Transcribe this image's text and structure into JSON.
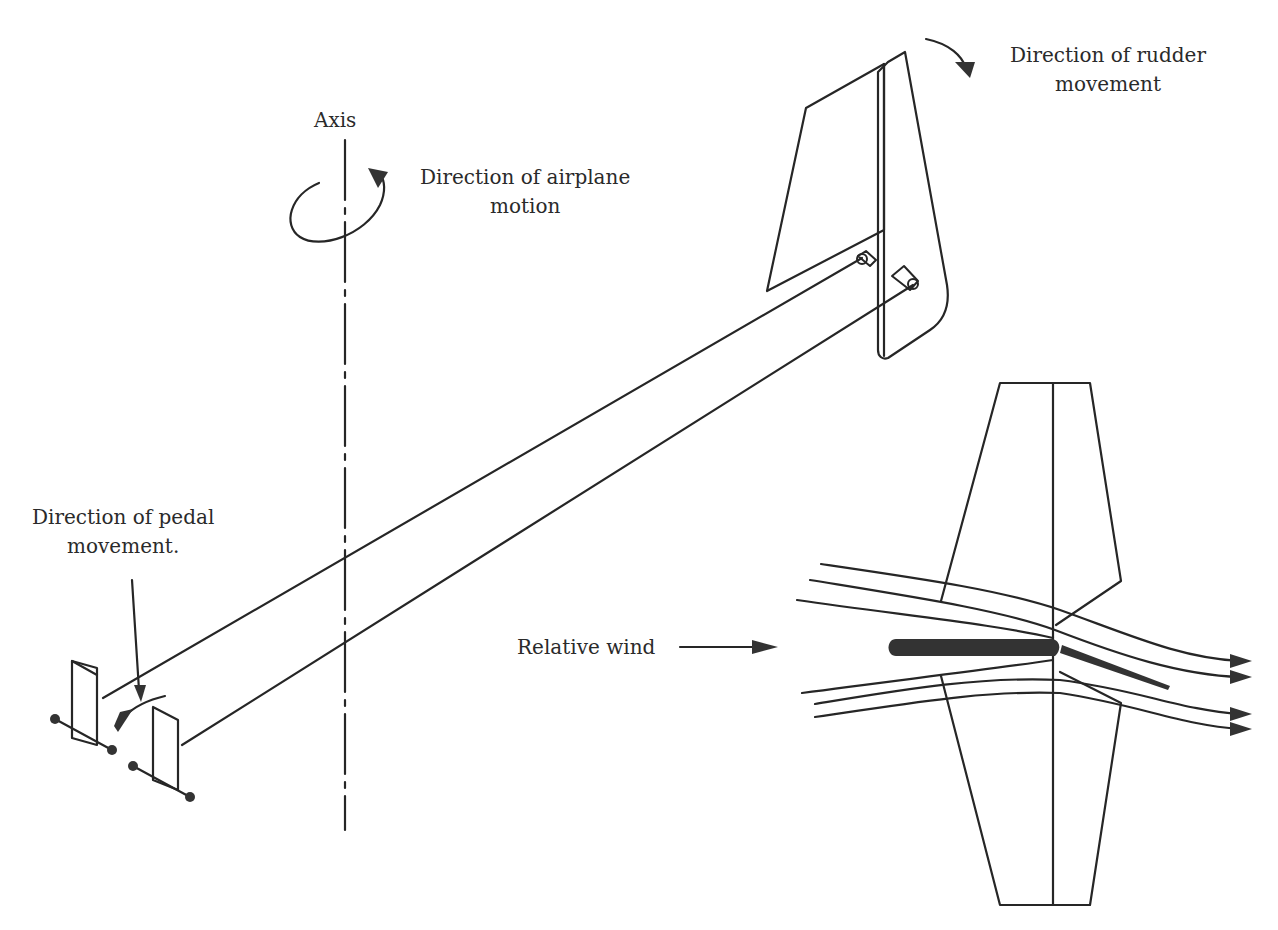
{
  "figure": {
    "colors": {
      "ink": "#262626",
      "background": "#ffffff",
      "airfoil_fill": "#3a3a3a"
    }
  },
  "labels": {
    "axis": "Axis",
    "airplane_motion_line1": "Direction of airplane",
    "airplane_motion_line2": "motion",
    "rudder_movement_line1": "Direction of rudder",
    "rudder_movement_line2": "movement",
    "pedal_movement_line1": "Direction of pedal",
    "pedal_movement_line2": "movement.",
    "relative_wind": "Relative wind"
  },
  "components": [
    {
      "id": "vertical-axis",
      "style": "dash-dot"
    },
    {
      "id": "rotation-arrow",
      "direction": "counter-clockwise-viewed-from-top"
    },
    {
      "id": "vertical-fin-and-rudder",
      "view": "perspective"
    },
    {
      "id": "control-cables",
      "count": 2
    },
    {
      "id": "rudder-pedals",
      "count": 2
    },
    {
      "id": "tail-plan-view",
      "view": "top"
    },
    {
      "id": "airflow-streamlines",
      "count": 6,
      "arrowheads": 4
    }
  ]
}
